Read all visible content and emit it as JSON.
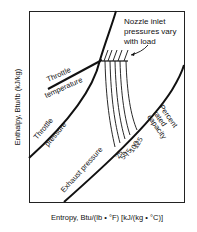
{
  "diagram": {
    "type": "mollier-chart",
    "axes": {
      "y_label": "Enthalpy, Btu/lb (kJ/kg)",
      "x_label": "Entropy, Btu/(lb • °F) [kJ/(kg • °C)]"
    },
    "curves": {
      "throttle_pressure": "Throttle pressure",
      "throttle_pressure_line1": "Throttle",
      "throttle_pressure_line2": "pressure",
      "throttle_temperature_line1": "Throttle",
      "throttle_temperature_line2": "temperature",
      "exhaust_pressure": "Exhaust pressure"
    },
    "annotation": {
      "line1": "Nozzle inlet",
      "line2": "pressures vary",
      "line3": "with load"
    },
    "capacity": {
      "title_line1": "Percent",
      "title_line2": "rated",
      "title_line3": "capacity",
      "values": [
        "125",
        "100",
        "75",
        "50",
        "25"
      ]
    }
  }
}
